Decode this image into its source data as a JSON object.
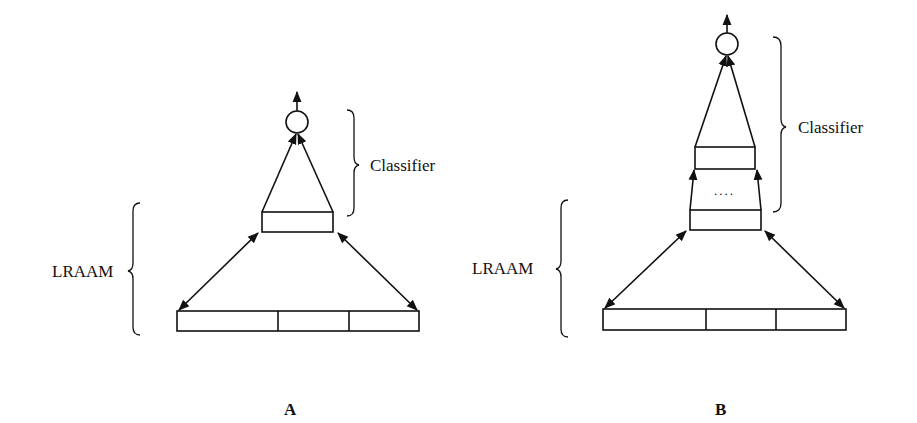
{
  "figure": {
    "panels": [
      {
        "id": "A",
        "panel_label": "A",
        "classifier_label": "Classifier",
        "encoder_label": "LRAAM",
        "hidden_layers": 1,
        "input_slots": 3
      },
      {
        "id": "B",
        "panel_label": "B",
        "classifier_label": "Classifier",
        "encoder_label": "LRAAM",
        "hidden_layers": "multiple",
        "ellipsis": "....",
        "input_slots": 3
      }
    ],
    "colors": {
      "stroke": "#111111",
      "background": "#ffffff"
    }
  }
}
